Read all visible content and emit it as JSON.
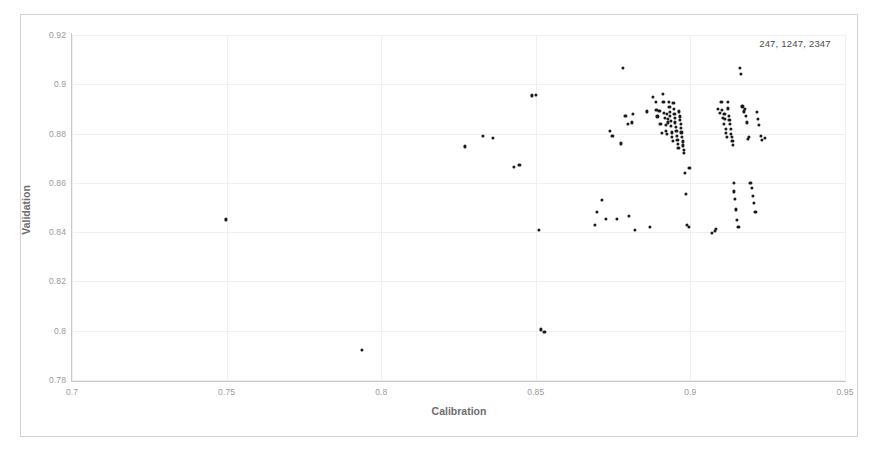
{
  "chart_data": {
    "type": "scatter",
    "title": "",
    "xlabel": "Calibration",
    "ylabel": "Validation",
    "xlim": [
      0.7,
      0.95
    ],
    "ylim": [
      0.78,
      0.92
    ],
    "xticks": [
      "0.7",
      "0.75",
      "0.8",
      "0.85",
      "0.9",
      "0.95"
    ],
    "xtick_values": [
      0.7,
      0.75,
      0.8,
      0.85,
      0.9,
      0.95
    ],
    "yticks": [
      "0.78",
      "0.8",
      "0.82",
      "0.84",
      "0.86",
      "0.88",
      "0.9",
      "0.92"
    ],
    "ytick_values": [
      0.78,
      0.8,
      0.82,
      0.84,
      0.86,
      0.88,
      0.9,
      0.92
    ],
    "grid": true,
    "legend_position": "top-right",
    "annotation": "247, 1247, 2347",
    "marker_color": "#1a1a1a",
    "point_count": 131,
    "points": [
      [
        0.7497,
        0.8452
      ],
      [
        0.7938,
        0.7921
      ],
      [
        0.8272,
        0.8748
      ],
      [
        0.833,
        0.879
      ],
      [
        0.836,
        0.8783
      ],
      [
        0.843,
        0.8665
      ],
      [
        0.8447,
        0.8672
      ],
      [
        0.8487,
        0.8955
      ],
      [
        0.85,
        0.8957
      ],
      [
        0.851,
        0.8408
      ],
      [
        0.8516,
        0.8005
      ],
      [
        0.8528,
        0.7995
      ],
      [
        0.869,
        0.843
      ],
      [
        0.8697,
        0.8483
      ],
      [
        0.8713,
        0.853
      ],
      [
        0.8726,
        0.8455
      ],
      [
        0.874,
        0.8812
      ],
      [
        0.8748,
        0.879
      ],
      [
        0.8762,
        0.8455
      ],
      [
        0.8775,
        0.876
      ],
      [
        0.8782,
        0.9065
      ],
      [
        0.879,
        0.8872
      ],
      [
        0.8797,
        0.8838
      ],
      [
        0.88,
        0.8465
      ],
      [
        0.881,
        0.8845
      ],
      [
        0.8815,
        0.888
      ],
      [
        0.882,
        0.841
      ],
      [
        0.886,
        0.889
      ],
      [
        0.8868,
        0.842
      ],
      [
        0.888,
        0.895
      ],
      [
        0.8888,
        0.893
      ],
      [
        0.889,
        0.8895
      ],
      [
        0.8893,
        0.887
      ],
      [
        0.89,
        0.8893
      ],
      [
        0.8903,
        0.884
      ],
      [
        0.8907,
        0.8802
      ],
      [
        0.891,
        0.896
      ],
      [
        0.8913,
        0.893
      ],
      [
        0.8915,
        0.8885
      ],
      [
        0.8918,
        0.8862
      ],
      [
        0.892,
        0.8835
      ],
      [
        0.8921,
        0.8812
      ],
      [
        0.8923,
        0.88
      ],
      [
        0.8925,
        0.888
      ],
      [
        0.8927,
        0.8858
      ],
      [
        0.8928,
        0.8845
      ],
      [
        0.893,
        0.893
      ],
      [
        0.8932,
        0.8908
      ],
      [
        0.8933,
        0.8888
      ],
      [
        0.8935,
        0.8872
      ],
      [
        0.8937,
        0.8852
      ],
      [
        0.8938,
        0.883
      ],
      [
        0.894,
        0.8805
      ],
      [
        0.8941,
        0.8788
      ],
      [
        0.8943,
        0.877
      ],
      [
        0.8945,
        0.8925
      ],
      [
        0.8946,
        0.89
      ],
      [
        0.8948,
        0.888
      ],
      [
        0.895,
        0.8862
      ],
      [
        0.8951,
        0.8845
      ],
      [
        0.8953,
        0.8828
      ],
      [
        0.8955,
        0.881
      ],
      [
        0.8956,
        0.8792
      ],
      [
        0.8958,
        0.8775
      ],
      [
        0.896,
        0.8758
      ],
      [
        0.8961,
        0.8742
      ],
      [
        0.8963,
        0.889
      ],
      [
        0.8965,
        0.887
      ],
      [
        0.8966,
        0.8855
      ],
      [
        0.8968,
        0.884
      ],
      [
        0.897,
        0.8822
      ],
      [
        0.8971,
        0.8805
      ],
      [
        0.8973,
        0.8786
      ],
      [
        0.8975,
        0.8768
      ],
      [
        0.8977,
        0.8752
      ],
      [
        0.8979,
        0.8735
      ],
      [
        0.898,
        0.872
      ],
      [
        0.8983,
        0.864
      ],
      [
        0.8986,
        0.8555
      ],
      [
        0.899,
        0.8428
      ],
      [
        0.8994,
        0.842
      ],
      [
        0.8997,
        0.866
      ],
      [
        0.907,
        0.8398
      ],
      [
        0.9078,
        0.8405
      ],
      [
        0.9082,
        0.8412
      ],
      [
        0.909,
        0.89
      ],
      [
        0.9095,
        0.8885
      ],
      [
        0.91,
        0.893
      ],
      [
        0.9103,
        0.8895
      ],
      [
        0.9106,
        0.8862
      ],
      [
        0.9108,
        0.884
      ],
      [
        0.911,
        0.888
      ],
      [
        0.9112,
        0.8858
      ],
      [
        0.9114,
        0.882
      ],
      [
        0.9116,
        0.8802
      ],
      [
        0.9118,
        0.8788
      ],
      [
        0.912,
        0.893
      ],
      [
        0.9122,
        0.8902
      ],
      [
        0.9124,
        0.8872
      ],
      [
        0.9126,
        0.8855
      ],
      [
        0.9128,
        0.8838
      ],
      [
        0.913,
        0.8818
      ],
      [
        0.9132,
        0.88
      ],
      [
        0.9134,
        0.8788
      ],
      [
        0.9136,
        0.877
      ],
      [
        0.9138,
        0.8755
      ],
      [
        0.914,
        0.86
      ],
      [
        0.9142,
        0.8565
      ],
      [
        0.9144,
        0.8535
      ],
      [
        0.9146,
        0.8492
      ],
      [
        0.915,
        0.845
      ],
      [
        0.9155,
        0.8422
      ],
      [
        0.916,
        0.9065
      ],
      [
        0.9163,
        0.9042
      ],
      [
        0.9168,
        0.891
      ],
      [
        0.9172,
        0.889
      ],
      [
        0.9176,
        0.89
      ],
      [
        0.918,
        0.8872
      ],
      [
        0.9183,
        0.8845
      ],
      [
        0.9186,
        0.878
      ],
      [
        0.919,
        0.8785
      ],
      [
        0.9194,
        0.86
      ],
      [
        0.9198,
        0.8578
      ],
      [
        0.9202,
        0.8548
      ],
      [
        0.9206,
        0.8518
      ],
      [
        0.921,
        0.8483
      ],
      [
        0.9215,
        0.8888
      ],
      [
        0.9218,
        0.886
      ],
      [
        0.9222,
        0.8835
      ],
      [
        0.9228,
        0.879
      ],
      [
        0.9232,
        0.8775
      ],
      [
        0.924,
        0.8782
      ]
    ]
  }
}
